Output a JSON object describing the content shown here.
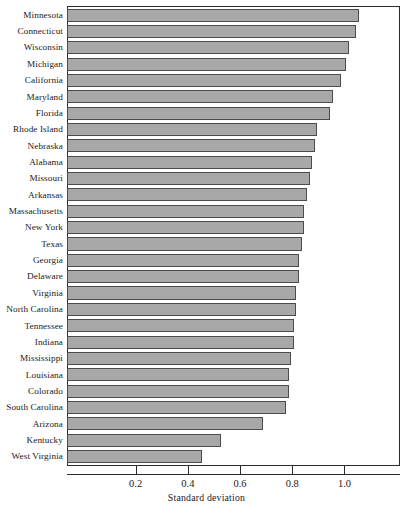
{
  "chart_data": {
    "type": "bar",
    "orientation": "horizontal",
    "title": "",
    "xlabel": "Standard deviation",
    "ylabel": "",
    "xlim": [
      -0.059,
      1.209
    ],
    "xticks": [
      0.2,
      0.4,
      0.6,
      0.8,
      1.0
    ],
    "xticklabels": [
      "0.2",
      "0.4",
      "0.6",
      "0.8",
      "1.0"
    ],
    "grid": false,
    "legend": null,
    "bar_color": "#a8a8a8",
    "bar_edge_color": "#4c4c4c",
    "categories": [
      "Minnesota",
      "Connecticut",
      "Wisconsin",
      "Michigan",
      "California",
      "Maryland",
      "Florida",
      "Rhode Island",
      "Nebraska",
      "Alabama",
      "Missouri",
      "Arkansas",
      "Massachusetts",
      "New York",
      "Texas",
      "Georgia",
      "Delaware",
      "Virginia",
      "North Carolina",
      "Tennessee",
      "Indiana",
      "Mississippi",
      "Louisiana",
      "Colorado",
      "South Carolina",
      "Arizona",
      "Kentucky",
      "West Virginia"
    ],
    "values": [
      1.06,
      1.05,
      1.02,
      1.01,
      0.99,
      0.96,
      0.95,
      0.9,
      0.89,
      0.88,
      0.87,
      0.86,
      0.85,
      0.85,
      0.84,
      0.83,
      0.83,
      0.82,
      0.82,
      0.81,
      0.81,
      0.8,
      0.79,
      0.79,
      0.78,
      0.69,
      0.53,
      0.46
    ]
  },
  "axis": {
    "title": "Standard deviation"
  }
}
